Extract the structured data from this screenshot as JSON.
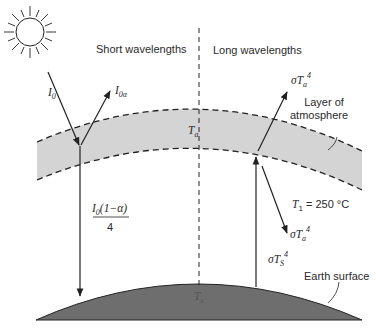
{
  "diagram": {
    "regions": {
      "left_label": "Short wavelengths",
      "right_label": "Long wavelengths"
    },
    "atmosphere": {
      "label_line1": "Layer of",
      "label_line2": "atmosphere",
      "temp_symbol": "T",
      "temp_sub": "a",
      "fill_color": "#d4d4d4"
    },
    "earth": {
      "label": "Earth surface",
      "temp_symbol": "T",
      "temp_sub": "s",
      "fill_color": "#6e6e6e"
    },
    "fluxes": {
      "incoming": {
        "symbol": "I",
        "sub": "0"
      },
      "reflected": {
        "symbol": "I",
        "sub": "0α"
      },
      "absorbed_num_symbol": "I",
      "absorbed_num_sub": "0",
      "absorbed_num_rest": "(1−α)",
      "absorbed_den": "4",
      "atm_up": {
        "sigma": "σT",
        "sub": "a",
        "sup": "4"
      },
      "atm_down": {
        "sigma": "σT",
        "sub": "a",
        "sup": "4"
      },
      "surface_up": {
        "sigma": "σT",
        "sub": "S",
        "sup": "4"
      }
    },
    "temperature_note": {
      "symbol": "T",
      "sub": "1",
      "rest": " = 250 °C"
    },
    "colors": {
      "line": "#222222",
      "atmosphere": "#d4d4d4",
      "earth": "#6e6e6e"
    }
  }
}
